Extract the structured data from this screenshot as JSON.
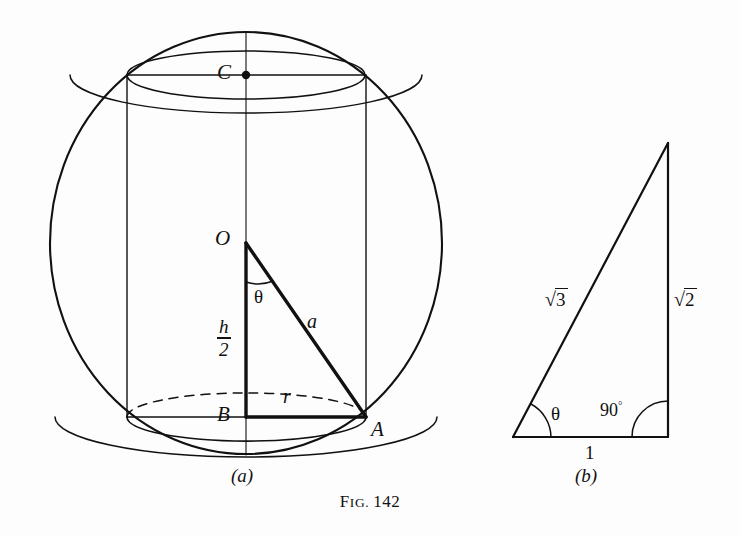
{
  "figure": {
    "caption_prefix": "F",
    "caption_prefix_rest": "IG.",
    "caption_number": "142",
    "caption_full": "Fig. 142",
    "background_color": "#fdfdfd",
    "ink_color": "#111111"
  },
  "panel_a": {
    "sub_caption": "(a)",
    "description": "Sphere circumscribing a right circular cylinder with inscribed right triangle OBA",
    "labels": {
      "center_top": "C",
      "center": "O",
      "base_center": "B",
      "base_rim": "A",
      "angle": "θ",
      "hypotenuse": "a",
      "radius": "r",
      "half_height_numerator": "h",
      "half_height_denominator": "2"
    },
    "geometry": {
      "sphere_center": [
        246,
        243
      ],
      "sphere_radius_x": 196,
      "sphere_radius_y": 211,
      "cylinder_left_x": 127,
      "cylinder_right_x": 366,
      "cylinder_top_y": 75,
      "cylinder_bottom_y": 417,
      "ellipse_ry": 24,
      "point_C": [
        246,
        75
      ],
      "point_O": [
        246,
        243
      ],
      "point_B": [
        246,
        417
      ],
      "point_A": [
        366,
        417
      ]
    }
  },
  "panel_b": {
    "sub_caption": "(b)",
    "description": "Reference right triangle with legs 1 and √2 and hypotenuse √3",
    "labels": {
      "hypotenuse_sign": "√",
      "hypotenuse_radicand": "3",
      "hypotenuse": "√3",
      "vertical_sign": "√",
      "vertical_radicand": "2",
      "vertical": "√2",
      "base": "1",
      "angle_theta": "θ",
      "angle_right": "90",
      "angle_right_degree": "°",
      "angle_right_full": "90°"
    },
    "geometry": {
      "vertex_left": [
        513,
        437
      ],
      "vertex_right": [
        668,
        437
      ],
      "vertex_top": [
        668,
        143
      ]
    }
  }
}
